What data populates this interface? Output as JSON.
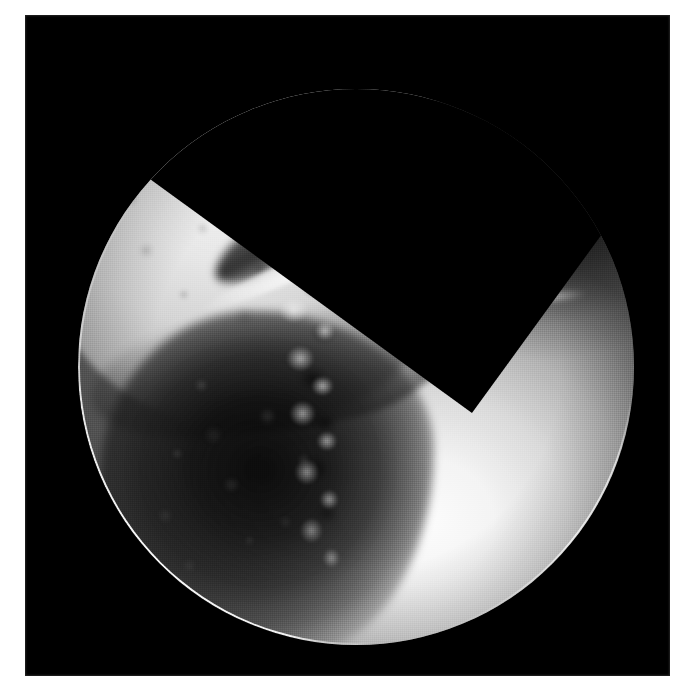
{
  "page": {
    "background_color": "#ffffff",
    "width_px": 693,
    "height_px": 690,
    "content_type": "photograph"
  },
  "plate": {
    "name": "black-photographic-plate",
    "background_color": "#000000",
    "left_px": 25,
    "top_px": 15,
    "width_px": 645,
    "height_px": 661
  },
  "scope_view": {
    "shape": "circle",
    "center_x_px": 356,
    "center_y_px": 367,
    "radius_px": 278,
    "modality": "arthroscopy",
    "color_mode": "grayscale",
    "rim_highlight_color": "#ffffff",
    "surround_color": "#000000"
  },
  "regions": [
    {
      "name": "upper-left-cartilage-surface",
      "tone": "bright",
      "hex": "#e6e6e6",
      "description": "broad light-grey mottled articular surface occupying the upper-left of the field"
    },
    {
      "name": "diagonal-crevice",
      "tone": "dark",
      "hex": "#1a1a1a",
      "description": "dark band running from upper-right to lower-left, separating two tissue surfaces"
    },
    {
      "name": "crevice-specular-ridge",
      "tone": "highlight",
      "hex": "#fafafa",
      "description": "bright linear reflection along the lower lip of the crevice"
    },
    {
      "name": "fibrillated-cartilage-edge",
      "tone": "mixed",
      "hex": "#d9d9d9",
      "description": "frayed, jagged border running vertically through the centre of the field"
    },
    {
      "name": "lower-left-cavity",
      "tone": "very-dark",
      "hex": "#0c0c0c",
      "description": "dark grainy recess in the lower-left quadrant"
    },
    {
      "name": "lower-right-illuminated-surface",
      "tone": "very-bright",
      "hex": "#fdfdfd",
      "description": "strongly lit smooth convex surface filling the lower-right of the field"
    },
    {
      "name": "upper-right-shadow",
      "tone": "dark",
      "hex": "#141414",
      "description": "shadowed pocket in the upper-right quadrant fading toward the rim"
    },
    {
      "name": "right-tissue-strands",
      "tone": "highlight",
      "hex": "#f7f7f7",
      "description": "thin bright wispy strands of tissue on the right side of the field"
    }
  ]
}
